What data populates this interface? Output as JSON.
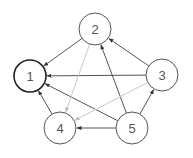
{
  "diagram": {
    "type": "directed-graph",
    "colors": {
      "node_stroke": "#555555",
      "node_stroke_emphasis": "#222222",
      "edge_dark": "#555555",
      "edge_light": "#c8c8c8",
      "label": "#555555",
      "background": "#ffffff"
    },
    "nodes": [
      {
        "id": "1",
        "label": "1",
        "cx": 30,
        "cy": 76,
        "r": 16,
        "emphasis": true
      },
      {
        "id": "2",
        "label": "2",
        "cx": 95,
        "cy": 29,
        "r": 16,
        "emphasis": false
      },
      {
        "id": "3",
        "label": "3",
        "cx": 162,
        "cy": 75,
        "r": 16,
        "emphasis": false
      },
      {
        "id": "4",
        "label": "4",
        "cx": 60,
        "cy": 128,
        "r": 16,
        "emphasis": false
      },
      {
        "id": "5",
        "label": "5",
        "cx": 132,
        "cy": 128,
        "r": 16,
        "emphasis": false
      }
    ],
    "edges": [
      {
        "from": "2",
        "to": "1",
        "style": "dark"
      },
      {
        "from": "3",
        "to": "1",
        "style": "dark"
      },
      {
        "from": "5",
        "to": "1",
        "style": "dark"
      },
      {
        "from": "4",
        "to": "1",
        "style": "dark"
      },
      {
        "from": "3",
        "to": "2",
        "style": "dark"
      },
      {
        "from": "5",
        "to": "2",
        "style": "dark"
      },
      {
        "from": "5",
        "to": "3",
        "style": "dark"
      },
      {
        "from": "5",
        "to": "4",
        "style": "dark"
      },
      {
        "from": "2",
        "to": "4",
        "style": "light"
      },
      {
        "from": "3",
        "to": "4",
        "style": "light"
      }
    ]
  }
}
